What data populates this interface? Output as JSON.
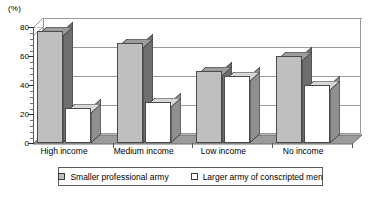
{
  "chart_data": {
    "type": "bar",
    "title": "",
    "subtitle": "",
    "unit_label": "(%)",
    "xlabel": "",
    "ylabel": "",
    "ylim": [
      0,
      80
    ],
    "yticks": [
      0,
      20,
      40,
      60,
      80
    ],
    "ytick_labels": [
      "0",
      "20",
      "40",
      "60",
      "80"
    ],
    "grid": true,
    "grid_orientation": "horizontal",
    "legend_position": "bottom",
    "style": "3d-bar",
    "categories": [
      "High income",
      "Medium income",
      "Low income",
      "No income"
    ],
    "series": [
      {
        "name": "Smaller professional army",
        "color": "#bfbfbf",
        "values": [
          77,
          69,
          50,
          60
        ]
      },
      {
        "name": "Larger army of conscripted men",
        "color": "#ffffff",
        "values": [
          24,
          28,
          46,
          40
        ]
      }
    ]
  },
  "legend": {
    "items": [
      {
        "label": "Smaller professional army",
        "swatch": "gray"
      },
      {
        "label": "Larger army of conscripted men",
        "swatch": "white"
      }
    ]
  }
}
